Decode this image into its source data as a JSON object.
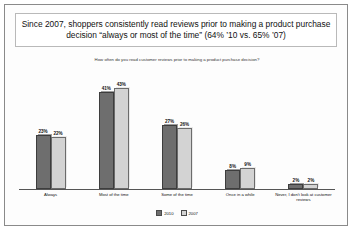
{
  "chart_data": {
    "type": "bar",
    "title": "Since 2007, shoppers consistently read reviews prior to making a product purchase decision “always or most of the time” (64% ’10 vs. 65% ’07)",
    "subtitle": "How often do you read customer reviews prior to making a product purchase decision?",
    "categories": [
      "Always",
      "Most of the time",
      "Some of the time",
      "Once in a while",
      "Never, I don't look at customer reviews"
    ],
    "series": [
      {
        "name": "2010",
        "values": [
          23,
          41,
          27,
          8,
          2
        ],
        "color": "#6e6e6e"
      },
      {
        "name": "2007",
        "values": [
          22,
          43,
          26,
          9,
          2
        ],
        "color": "#d3d3d3"
      }
    ],
    "value_labels": [
      [
        "23%",
        "22%"
      ],
      [
        "41%",
        "43%"
      ],
      [
        "27%",
        "26%"
      ],
      [
        "8%",
        "9%"
      ],
      [
        "2%",
        "2%"
      ]
    ],
    "xlabel": "",
    "ylabel": "",
    "ylim": [
      0,
      50
    ],
    "grid": false,
    "legend_position": "bottom",
    "legend": [
      "2010",
      "2007"
    ]
  }
}
